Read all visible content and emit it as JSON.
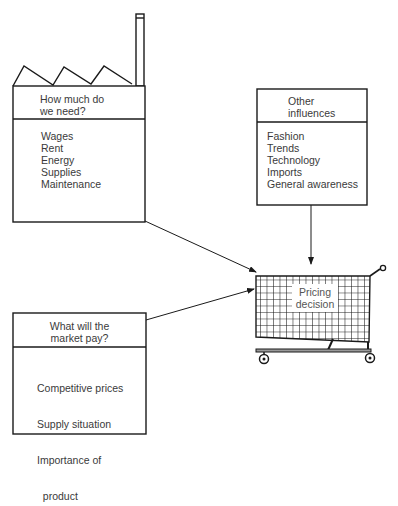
{
  "factory": {
    "heading": [
      "How much do",
      "we need?"
    ],
    "items": [
      "Wages",
      "Rent",
      "Energy",
      "Supplies",
      "Maintenance"
    ]
  },
  "influences": {
    "heading": [
      "Other",
      "influences"
    ],
    "items": [
      "Fashion",
      "Trends",
      "Technology",
      "Imports",
      "General awareness"
    ]
  },
  "market": {
    "heading": [
      "What will the",
      "market pay?"
    ],
    "items": [
      "Competitive prices",
      "Supply situation",
      "Importance of",
      "  product"
    ]
  },
  "cart": {
    "label": [
      "Pricing",
      "decision"
    ]
  },
  "colors": {
    "ink": "#1a1a1a",
    "text": "#3a3a3a"
  }
}
